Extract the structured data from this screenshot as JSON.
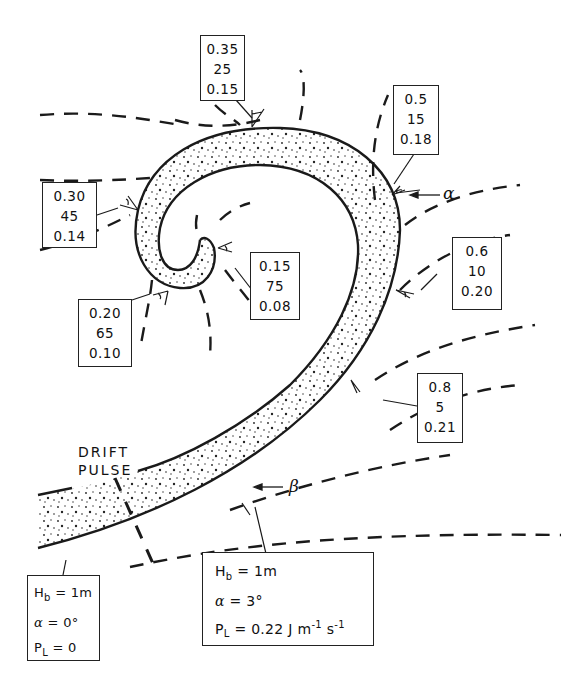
{
  "annotation_boxes": [
    {
      "id": "box-top",
      "values": [
        "0.35",
        "25",
        "0.15"
      ]
    },
    {
      "id": "box-upper-right",
      "values": [
        "0.5",
        "15",
        "0.18"
      ]
    },
    {
      "id": "box-left",
      "values": [
        "0.30",
        "45",
        "0.14"
      ]
    },
    {
      "id": "box-inner",
      "values": [
        "0.15",
        "75",
        "0.08"
      ]
    },
    {
      "id": "box-lower-left",
      "values": [
        "0.20",
        "65",
        "0.10"
      ]
    },
    {
      "id": "box-right",
      "values": [
        "0.6",
        "10",
        "0.20"
      ]
    },
    {
      "id": "box-lower-right",
      "values": [
        "0.8",
        "5",
        "0.21"
      ]
    }
  ],
  "labels": {
    "drift_line1": "DRIFT",
    "drift_line2": "PULSE",
    "alpha": "α",
    "beta": "β"
  },
  "param_box_left": {
    "hb": "H",
    "hb_sub": "b",
    "hb_val": " = 1m",
    "alpha": "α",
    "alpha_val": " = 0°",
    "pl": "P",
    "pl_sub": "L",
    "pl_val": " = 0"
  },
  "param_box_right": {
    "hb": "H",
    "hb_sub": "b",
    "hb_val": " = 1m",
    "alpha": "α",
    "alpha_val": " = 3°",
    "pl": "P",
    "pl_sub": "L",
    "pl_val": " = 0.22 J m",
    "pl_exp1": "-1",
    "pl_unit2": " s",
    "pl_exp2": "-1"
  },
  "colors": {
    "ink": "#1a1a1a",
    "background": "#ffffff"
  }
}
